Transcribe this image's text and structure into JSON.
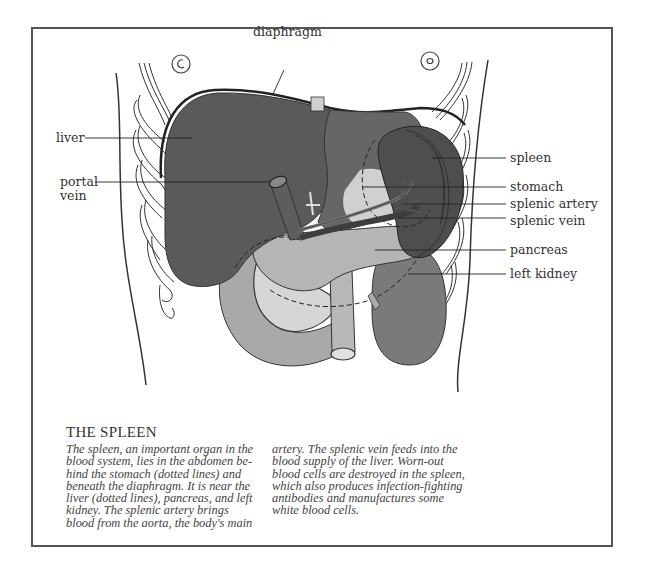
{
  "figure": {
    "labels": {
      "diaphragm": "diaphragm",
      "liver": "liver",
      "portal_vein_line1": "portal",
      "portal_vein_line2": "vein",
      "spleen": "spleen",
      "stomach": "stomach",
      "splenic_artery": "splenic artery",
      "splenic_vein": "splenic vein",
      "pancreas": "pancreas",
      "left_kidney": "left kidney"
    },
    "colors": {
      "liver": "#5a5a5a",
      "stomach": "#666666",
      "spleen": "#4e4e4e",
      "pancreas": "#b5b5b5",
      "duodenum": "#a9a9a9",
      "kidney": "#7a7a7a",
      "light_area": "#d6d6d6",
      "outline": "#2a2a2a",
      "frame": "#555555"
    }
  },
  "caption": {
    "title": "THE SPLEEN",
    "column1": [
      "The spleen, an important organ in the",
      "blood system, lies in the abdomen be-",
      "hind the stomach (dotted lines) and",
      "beneath the diaphragm. It is near the",
      "liver (dotted lines), pancreas, and left",
      "kidney. The splenic artery brings",
      "blood from the aorta, the body's main"
    ],
    "column2": [
      "artery. The splenic vein feeds into the",
      "blood supply of the liver. Worn-out",
      "blood cells are destroyed in the spleen,",
      "which also produces infection-fighting",
      "antibodies and manufactures some",
      "white blood cells."
    ]
  }
}
